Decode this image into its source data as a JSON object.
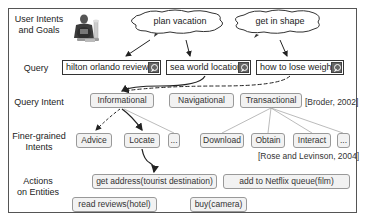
{
  "row_labels": {
    "goals": "User Intents and Goals",
    "goals_line1": "User Intents",
    "goals_line2": "and Goals",
    "query": "Query",
    "query_intent": "Query Intent",
    "finer_line1": "Finer-grained",
    "finer_line2": "Intents",
    "actions_line1": "Actions",
    "actions_line2": "on Entities"
  },
  "goals": [
    {
      "label": "plan vacation"
    },
    {
      "label": "get in shape"
    }
  ],
  "queries": [
    {
      "label": "hilton orlando reviews",
      "icon": "search-icon"
    },
    {
      "label": "sea world location",
      "icon": "search-icon"
    },
    {
      "label": "how to lose weight",
      "icon": "search-icon"
    }
  ],
  "query_intents": [
    {
      "label": "Informational"
    },
    {
      "label": "Navigational"
    },
    {
      "label": "Transactional"
    }
  ],
  "query_intent_citation": "[Broder, 2002]",
  "finer_intents": [
    {
      "label": "Advice",
      "parent": "Informational"
    },
    {
      "label": "Locate",
      "parent": "Informational"
    },
    {
      "label": "...",
      "parent": "Informational"
    },
    {
      "label": "Download",
      "parent": "Transactional"
    },
    {
      "label": "Obtain",
      "parent": "Transactional"
    },
    {
      "label": "Interact",
      "parent": "Transactional"
    },
    {
      "label": "...",
      "parent": "Transactional"
    }
  ],
  "finer_intent_citation": "[Rose and Levinson, 2004]",
  "actions": [
    {
      "label": "get address(tourist destination)"
    },
    {
      "label": "add to Netflix queue(film)"
    },
    {
      "label": "read reviews(hotel)"
    },
    {
      "label": "buy(camera)"
    }
  ],
  "colors": {
    "frame": "#555555",
    "box_fill": "#f2f2f2",
    "box_border": "#999999",
    "arrow": "#222222",
    "thin_line": "#aaaaaa"
  }
}
